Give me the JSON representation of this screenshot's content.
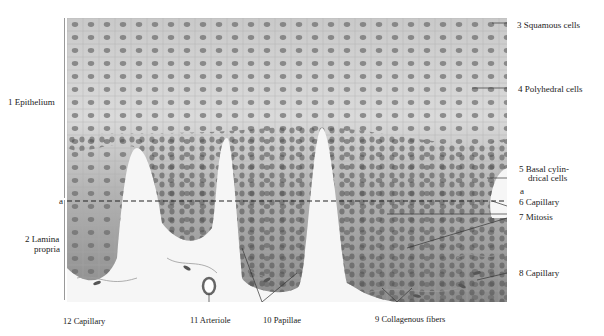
{
  "figure": {
    "labels": {
      "l1": "1  Epithelium",
      "l2a": "2  Lamina",
      "l2b": "propria",
      "l3": "3  Squamous cells",
      "l4": "4  Polyhedral cells",
      "l5a": "5  Basal cylin-",
      "l5b": "drical cells",
      "la_right": "a",
      "la_left": "a",
      "l6": "6  Capillary",
      "l7": "7  Mitosis",
      "l8": "8  Capillary",
      "l9": "9  Collagenous fibers",
      "l10": "10  Papillae",
      "l11": "11  Arteriole",
      "l12": "12  Capillary"
    },
    "colors": {
      "superficial": "#d9d9d9",
      "basal": "#8f8f8f",
      "connective": "#f4f4f4",
      "nucleus": "#5a5a5a"
    }
  }
}
